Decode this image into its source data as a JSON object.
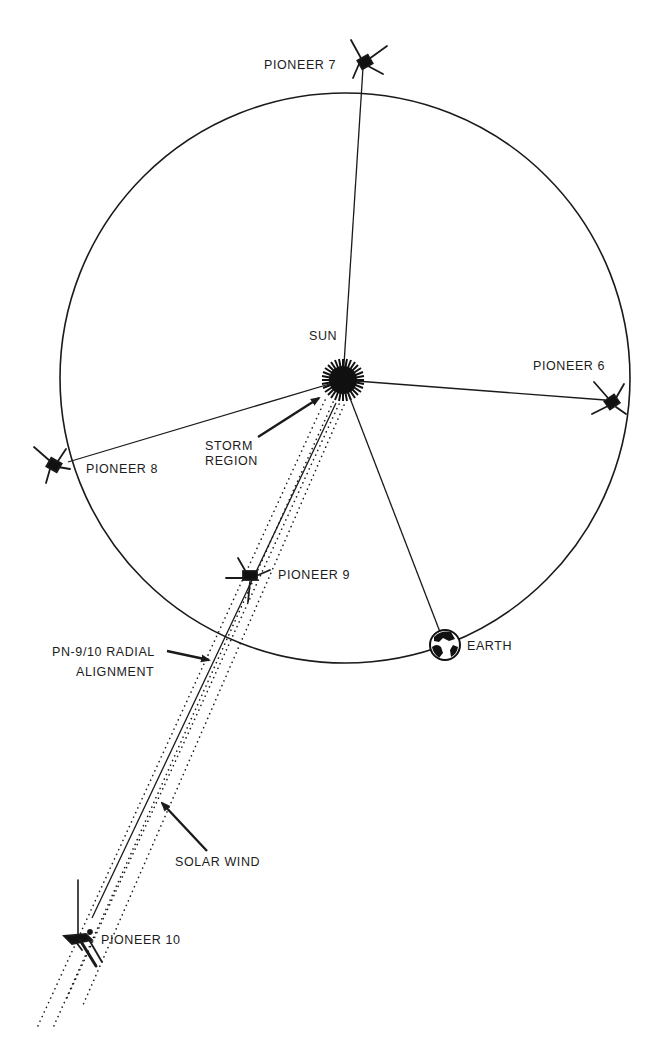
{
  "diagram": {
    "type": "heliocentric spacecraft alignment diagram",
    "colors": {
      "ink": "#1a1a1a",
      "background": "#ffffff"
    },
    "bodies": {
      "sun": {
        "label": "SUN"
      },
      "earth": {
        "label": "EARTH"
      }
    },
    "spacecraft": [
      {
        "id": "pioneer7",
        "label": "PIONEER 7"
      },
      {
        "id": "pioneer6",
        "label": "PIONEER 6"
      },
      {
        "id": "pioneer8",
        "label": "PIONEER 8"
      },
      {
        "id": "pioneer9",
        "label": "PIONEER 9"
      },
      {
        "id": "pioneer10",
        "label": "PIONEER 10"
      }
    ],
    "annotations": {
      "storm_region": [
        "STORM",
        "REGION"
      ],
      "radial_alignment": [
        "PN-9/10 RADIAL",
        "ALIGNMENT"
      ],
      "solar_wind": "SOLAR WIND"
    },
    "orbit": "Earth orbit circle"
  }
}
